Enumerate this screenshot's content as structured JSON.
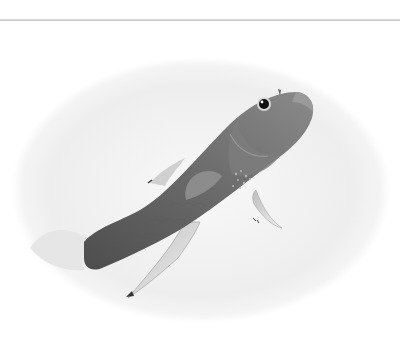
{
  "image": {
    "subject": "fish",
    "description": "Grayscale photograph of a fish swimming upward, framed in a soft oval vignette",
    "style": "black-and-white",
    "frame_shape": "oval-vignette"
  },
  "colors": {
    "background": "#ffffff",
    "rule": "#c9c9c9",
    "oval_fill": "#f1f1f1",
    "fish_body": "#6e6e6e",
    "fish_dark": "#4a4a4a"
  }
}
